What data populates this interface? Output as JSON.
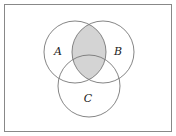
{
  "diagram": {
    "type": "venn",
    "sets": [
      {
        "id": "A",
        "label": "A"
      },
      {
        "id": "B",
        "label": "B"
      },
      {
        "id": "C",
        "label": "C"
      }
    ],
    "shaded_region": "A ∩ B",
    "colors": {
      "background": "#ffffff",
      "frame_stroke": "#888888",
      "circle_stroke": "#777777",
      "shade_fill": "#d4d4d4",
      "label": "#222222"
    }
  }
}
